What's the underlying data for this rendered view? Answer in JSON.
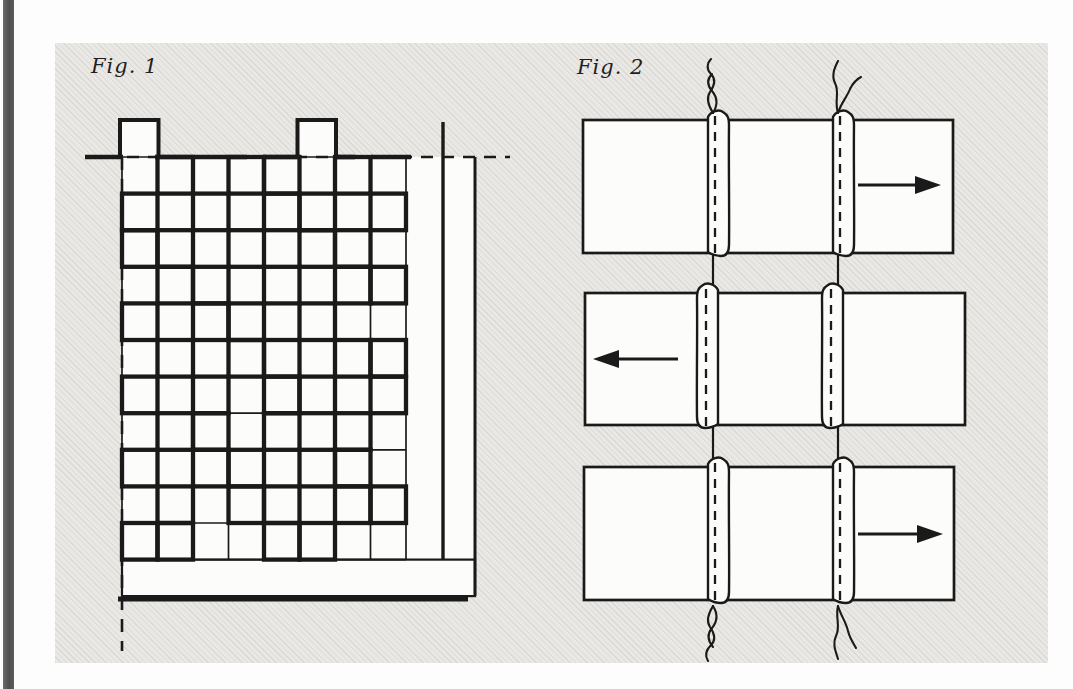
{
  "page": {
    "background": "#fdfdfd",
    "ink_color": "#1a1a1a",
    "panel_bg": "#e9e8e5",
    "paper_white": "#fcfcfa",
    "spine_bar_color": "#575757"
  },
  "figures": {
    "fig1": {
      "label": "Fig. 1",
      "kind": "patchwork-grid-diagram",
      "grid": {
        "cols": 8,
        "rows": 11,
        "thick_cell_pattern": [
          "01011010",
          "10101101",
          "11010110",
          "01101011",
          "10110100",
          "01011011",
          "10101101",
          "01101010",
          "10110110",
          "01011011",
          "11001100"
        ],
        "tabs_above_cols": [
          1,
          6
        ],
        "left_guide": "dashed-vertical-line",
        "top_guide": "dashed-horizontal-line",
        "bottom": "long-horizontal-bar-with-heavy-rule"
      }
    },
    "fig2": {
      "label": "Fig. 2",
      "kind": "seam-pressing-diagram",
      "seams_per_row": 2,
      "rows": [
        {
          "arrow": "right",
          "arrow_icon": "right-arrow",
          "flap_side": "right"
        },
        {
          "arrow": "left",
          "arrow_icon": "left-arrow",
          "flap_side": "left"
        },
        {
          "arrow": "right",
          "arrow_icon": "right-arrow",
          "flap_side": "right"
        }
      ],
      "threads": {
        "top": [
          "looped-thread",
          "double-strand-thread"
        ],
        "bottom": [
          "looped-thread",
          "double-strand-thread"
        ]
      }
    }
  }
}
